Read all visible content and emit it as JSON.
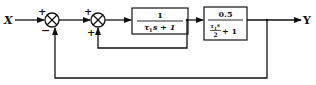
{
  "diagram": {
    "type": "block-diagram",
    "input_label": "X",
    "output_label": "Y",
    "summing_junctions": [
      {
        "id": "sum1",
        "top_sign": "+",
        "bottom_sign": "−"
      },
      {
        "id": "sum2",
        "top_sign": "+",
        "bottom_sign": "+"
      }
    ],
    "blocks": [
      {
        "id": "G1",
        "numerator": "1",
        "denominator_main": "τ",
        "denominator_sub": "1",
        "denominator_rest": "s + 1"
      },
      {
        "id": "G2",
        "numerator": "0.5",
        "frac_num_main": "τ",
        "frac_num_sub": "1",
        "frac_num_rest": "s",
        "frac_den": "2",
        "denominator_rest": "+ 1"
      }
    ],
    "connections": [
      "X → sum1 (+)",
      "sum1 → sum2 (+)",
      "sum2 → G1",
      "G1 → G2",
      "G1 output → sum2 (+) [inner feedback]",
      "G2 → Y",
      "Y → sum1 (−) [outer feedback]"
    ],
    "colors": {
      "line": "#111111",
      "background": "#ffffff"
    }
  }
}
